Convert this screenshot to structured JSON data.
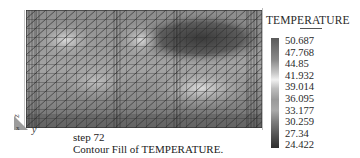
{
  "legend": {
    "title": "TEMPERATURE",
    "values": [
      "50.687",
      "47.768",
      "44.85",
      "41.932",
      "39.014",
      "36.095",
      "33.177",
      "30.259",
      "27.34",
      "24.422"
    ]
  },
  "axes": {
    "vertical": "z",
    "horizontal": "y",
    "depth": "x"
  },
  "caption": {
    "step": "step 72",
    "text": "Contour Fill of TEMPERATURE."
  },
  "field": {
    "min": 24.422,
    "max": 50.687,
    "description": "Grayscale contour fill; dark (high temp) region at top right, lighter blobs at top left, light band lower right"
  }
}
